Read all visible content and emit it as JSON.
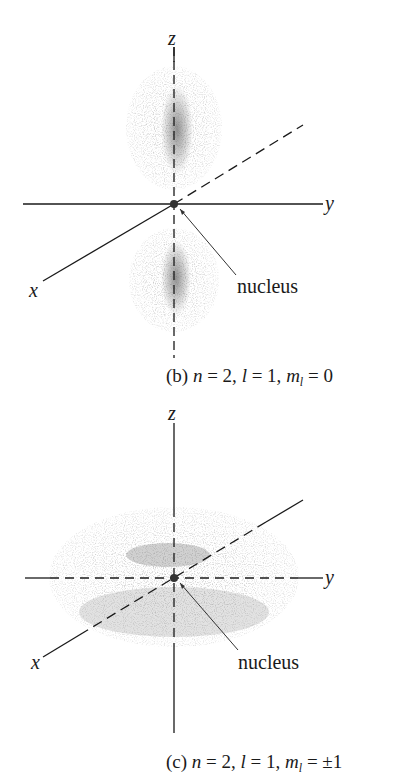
{
  "figure_b": {
    "axis_labels": {
      "x": "x",
      "y": "y",
      "z": "z"
    },
    "nucleus_label": "nucleus",
    "caption": {
      "prefix": "(b) ",
      "n_sym": "n",
      "n_val": " = 2, ",
      "l_sym": "l",
      "l_val": " = 1, ",
      "m_sym": "m",
      "m_sub": "l",
      "m_val": " = 0"
    },
    "shape": "dumbbell (two lobes along z)"
  },
  "figure_c": {
    "axis_labels": {
      "x": "x",
      "y": "y",
      "z": "z"
    },
    "nucleus_label": "nucleus",
    "caption": {
      "prefix": "(c) ",
      "n_sym": "n",
      "n_val": " = 2, ",
      "l_sym": "l",
      "l_val": " = 1, ",
      "m_sym": "m",
      "m_sub": "l",
      "m_val": " = ±1"
    },
    "shape": "torus in xy-plane"
  },
  "colors": {
    "ink": "#1a1a1a",
    "cloud_light": "#b8b8b8",
    "cloud_dark": "#7a7a7a"
  }
}
